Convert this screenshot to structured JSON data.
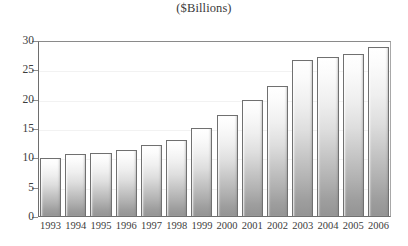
{
  "subtitle": "($Billions)",
  "title_remnant": "",
  "chart_data": {
    "type": "bar",
    "title": "",
    "subtitle": "($Billions)",
    "xlabel": "",
    "ylabel": "",
    "categories": [
      "1993",
      "1994",
      "1995",
      "1996",
      "1997",
      "1998",
      "1999",
      "2000",
      "2001",
      "2002",
      "2003",
      "2004",
      "2005",
      "2006"
    ],
    "values": [
      10.0,
      10.7,
      10.9,
      11.4,
      12.2,
      13.1,
      15.1,
      17.4,
      19.9,
      22.4,
      26.7,
      27.3,
      27.8,
      29.0
    ],
    "ylim": [
      0,
      30
    ],
    "ytick_labels": [
      "0",
      "5",
      "10",
      "15",
      "20",
      "25",
      "30"
    ],
    "ytick_values": [
      0,
      5,
      10,
      15,
      20,
      25,
      30
    ],
    "grid": false,
    "legend": "none",
    "units": "$Billions",
    "bar_fill_top": "#ffffff",
    "bar_fill_bottom": "#949494",
    "bar_border_color": "#707070",
    "axis_color": "#6e6e6e",
    "text_color": "#3c3c3c"
  }
}
